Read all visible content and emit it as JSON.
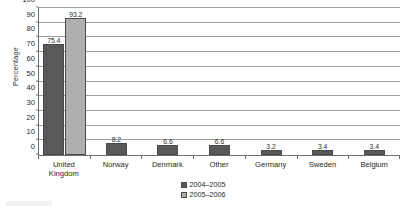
{
  "chart_data": {
    "type": "bar",
    "title": "",
    "subtitle": "",
    "xlabel": "",
    "ylabel": "Percentage",
    "ylim": [
      0,
      100
    ],
    "ytick_step": 10,
    "yticks": [
      "0",
      "10",
      "20",
      "30",
      "40",
      "50",
      "60",
      "70",
      "80",
      "90",
      "100"
    ],
    "grid": "horizontal",
    "legend_position": "bottom-center",
    "categories": [
      "United Kingdom",
      "Norway",
      "Denmark",
      "Other",
      "Germany",
      "Sweden",
      "Belgium"
    ],
    "category_lines": [
      [
        "United",
        "Kingdom"
      ],
      [
        "Norway"
      ],
      [
        "Denmark"
      ],
      [
        "Other"
      ],
      [
        "Germany"
      ],
      [
        "Sweden"
      ],
      [
        "Belgium"
      ]
    ],
    "series": [
      {
        "name": "2004-2005",
        "color": "#595959",
        "values": [
          75.4,
          8.2,
          6.6,
          6.6,
          3.2,
          3.4,
          3.4
        ]
      },
      {
        "name": "2005-2006",
        "color": "#b0b0b0",
        "values": [
          93.2,
          null,
          null,
          null,
          null,
          null,
          null
        ]
      }
    ],
    "data_labels": [
      [
        "75.4",
        "93.2"
      ],
      [
        "8.2"
      ],
      [
        "6.6"
      ],
      [
        "6.6"
      ],
      [
        "3.2"
      ],
      [
        "3.4"
      ],
      [
        "3.4"
      ]
    ]
  },
  "legend": {
    "items": [
      {
        "label": "2004–2005",
        "color": "#595959"
      },
      {
        "label": "2005–2006",
        "color": "#b0b0b0"
      }
    ]
  }
}
